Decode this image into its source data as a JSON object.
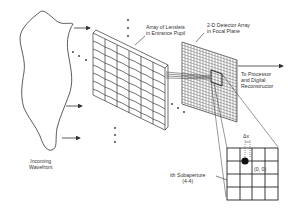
{
  "diagram": {
    "labels": {
      "lenslets_line1": "Array of Lenslets",
      "lenslets_line2": "in Entrance Pupil",
      "detector_line1": "2-D Detector Array",
      "detector_line2": "in Focal Plane",
      "processor_line1": "To Processor",
      "processor_line2": "and Digital",
      "processor_line3": "Reconstructor",
      "wavefront_line1": "Incoming",
      "wavefront_line2": "Wavefront",
      "subaperture_line1": "ith Subaperture",
      "subaperture_line2": "(4-4)",
      "delta_label": "Δx",
      "origin_label": "(0, 0)"
    },
    "components": [
      {
        "name": "incoming-wavefront",
        "shape": "irregular-closed-curve"
      },
      {
        "name": "lenslet-array",
        "grid": "6x8"
      },
      {
        "name": "detector-array",
        "grid": "fine-mesh"
      },
      {
        "name": "subaperture-inset",
        "grid": "4x4"
      }
    ],
    "colors": {
      "line": "#333333",
      "background": "#ffffff",
      "spot": "#111111"
    }
  }
}
